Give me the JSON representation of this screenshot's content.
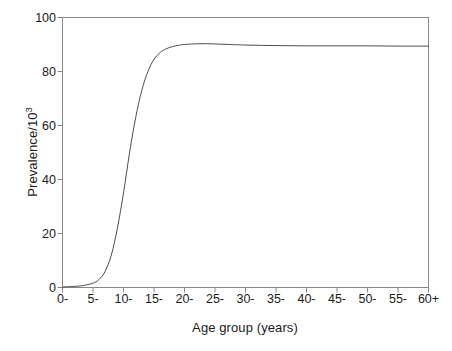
{
  "chart_data": {
    "type": "line",
    "title": "",
    "xlabel": "Age group (years)",
    "ylabel": "Prevalence/10",
    "ylabel_sup": "3",
    "ylim": [
      0,
      100
    ],
    "yticks": [
      0,
      20,
      40,
      60,
      80,
      100
    ],
    "ytick_labels": [
      "0",
      "20",
      "40",
      "60",
      "80",
      "100"
    ],
    "categories": [
      "0-",
      "5-",
      "10-",
      "15-",
      "20-",
      "25-",
      "30-",
      "35-",
      "40-",
      "45-",
      "50-",
      "55-",
      "60+"
    ],
    "xtick_labels": [
      "0-",
      "5-",
      "10-",
      "15-",
      "20-",
      "25-",
      "30-",
      "35-",
      "40-",
      "45-",
      "50-",
      "55-",
      "60+"
    ],
    "values": [
      0.3,
      1.5,
      45.0,
      84.0,
      89.7,
      90.2,
      89.8,
      89.6,
      89.5,
      89.5,
      89.5,
      89.4,
      89.4
    ],
    "grid": false,
    "legend": null,
    "series": [
      {
        "name": "Prevalence",
        "values": [
          0.3,
          1.5,
          45.0,
          84.0,
          89.7,
          90.2,
          89.8,
          89.6,
          89.5,
          89.5,
          89.5,
          89.4,
          89.4
        ]
      }
    ],
    "curve_points": [
      [
        0.0,
        0.2
      ],
      [
        1.0,
        0.3
      ],
      [
        2.0,
        0.4
      ],
      [
        3.0,
        0.6
      ],
      [
        4.0,
        1.0
      ],
      [
        5.0,
        1.6
      ],
      [
        6.0,
        3.0
      ],
      [
        7.0,
        6.0
      ],
      [
        8.0,
        12.0
      ],
      [
        9.0,
        22.0
      ],
      [
        10.0,
        35.0
      ],
      [
        11.0,
        50.0
      ],
      [
        12.0,
        63.0
      ],
      [
        13.0,
        73.0
      ],
      [
        14.0,
        80.0
      ],
      [
        15.0,
        84.5
      ],
      [
        16.0,
        87.0
      ],
      [
        17.0,
        88.4
      ],
      [
        18.0,
        89.2
      ],
      [
        19.0,
        89.7
      ],
      [
        20.0,
        90.0
      ],
      [
        22.5,
        90.3
      ],
      [
        25.0,
        90.2
      ],
      [
        27.5,
        90.0
      ],
      [
        30.0,
        89.8
      ],
      [
        35.0,
        89.6
      ],
      [
        40.0,
        89.5
      ],
      [
        45.0,
        89.5
      ],
      [
        50.0,
        89.5
      ],
      [
        55.0,
        89.4
      ],
      [
        60.0,
        89.4
      ]
    ],
    "axis_color": "#888888",
    "line_color": "#4d4d4d",
    "background": "#ffffff"
  }
}
